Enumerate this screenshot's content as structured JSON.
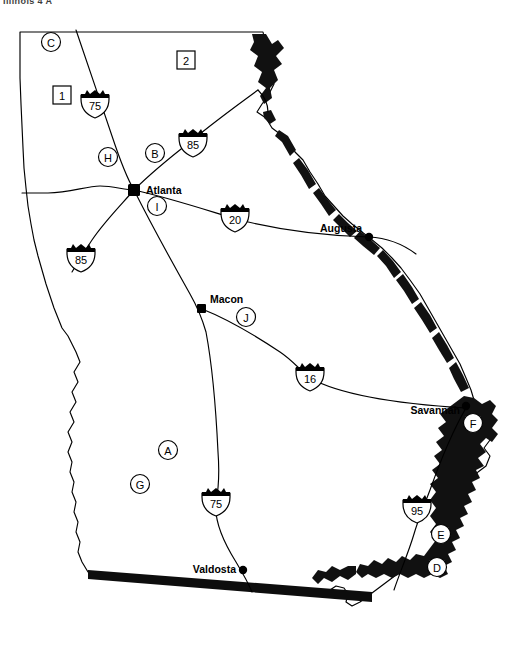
{
  "page": {
    "cropped_header_text": "Illinois 4 A",
    "width": 516,
    "height": 653,
    "background_color": "#ffffff",
    "ink_color": "#000000"
  },
  "map": {
    "state": "Georgia",
    "cities": [
      {
        "name": "Atlanta",
        "x": 134,
        "y": 190,
        "label_x": 146,
        "label_y": 194,
        "label_anchor": "start"
      },
      {
        "name": "Augusta",
        "x": 369,
        "y": 237,
        "label_x": 362,
        "label_y": 232,
        "label_anchor": "end"
      },
      {
        "name": "Macon",
        "x": 202,
        "y": 309,
        "label_x": 210,
        "label_y": 303,
        "label_anchor": "start"
      },
      {
        "name": "Savannah",
        "x": 466,
        "y": 408,
        "label_x": 460,
        "label_y": 414,
        "label_anchor": "end"
      },
      {
        "name": "Valdosta",
        "x": 243,
        "y": 570,
        "label_x": 236,
        "label_y": 572,
        "label_anchor": "end"
      }
    ],
    "interstate_shields": [
      {
        "number": "75",
        "x": 95,
        "y": 105,
        "name": "i-75-north-shield"
      },
      {
        "number": "85",
        "x": 193,
        "y": 144,
        "name": "i-85-northeast-shield"
      },
      {
        "number": "85",
        "x": 81,
        "y": 259,
        "name": "i-85-southwest-shield"
      },
      {
        "number": "20",
        "x": 235,
        "y": 219,
        "name": "i-20-shield"
      },
      {
        "number": "16",
        "x": 310,
        "y": 378,
        "name": "i-16-shield"
      },
      {
        "number": "75",
        "x": 216,
        "y": 503,
        "name": "i-75-south-shield"
      },
      {
        "number": "95",
        "x": 417,
        "y": 510,
        "name": "i-95-shield"
      }
    ],
    "circle_markers": [
      {
        "letter": "C",
        "x": 51,
        "y": 42,
        "name": "marker-c"
      },
      {
        "letter": "H",
        "x": 108,
        "y": 157,
        "name": "marker-h"
      },
      {
        "letter": "B",
        "x": 155,
        "y": 153,
        "name": "marker-b"
      },
      {
        "letter": "I",
        "x": 157,
        "y": 206,
        "name": "marker-i"
      },
      {
        "letter": "J",
        "x": 246,
        "y": 317,
        "name": "marker-j"
      },
      {
        "letter": "A",
        "x": 168,
        "y": 450,
        "name": "marker-a"
      },
      {
        "letter": "G",
        "x": 140,
        "y": 484,
        "name": "marker-g"
      },
      {
        "letter": "F",
        "x": 473,
        "y": 423,
        "name": "marker-f"
      },
      {
        "letter": "E",
        "x": 441,
        "y": 534,
        "name": "marker-e"
      },
      {
        "letter": "D",
        "x": 437,
        "y": 567,
        "name": "marker-d"
      }
    ],
    "box_markers": [
      {
        "number": "1",
        "x": 62,
        "y": 95,
        "name": "box-marker-1"
      },
      {
        "number": "2",
        "x": 186,
        "y": 60,
        "name": "box-marker-2"
      }
    ],
    "highways": [
      {
        "name": "i-75-north",
        "route": "75"
      },
      {
        "name": "i-85-northeast",
        "route": "85"
      },
      {
        "name": "i-85-southwest",
        "route": "85"
      },
      {
        "name": "i-20",
        "route": "20"
      },
      {
        "name": "i-16",
        "route": "16"
      },
      {
        "name": "i-75-south",
        "route": "75"
      },
      {
        "name": "i-95",
        "route": "95"
      },
      {
        "name": "west-spur",
        "route": ""
      }
    ]
  }
}
